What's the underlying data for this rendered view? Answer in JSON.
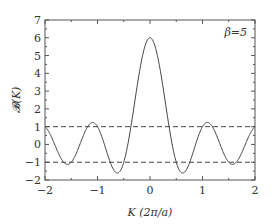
{
  "chart_data": {
    "type": "line",
    "title": "",
    "xlabel": "K (2π/a)",
    "ylabel": "𝓑(K)",
    "xlim": [
      -2,
      2
    ],
    "ylim": [
      -2,
      7
    ],
    "xticks": [
      -2,
      -1,
      0,
      1,
      2
    ],
    "xtick_labels": [
      "−2",
      "−1",
      "0",
      "1",
      "2"
    ],
    "yticks": [
      -2,
      -1,
      0,
      1,
      2,
      3,
      4,
      5,
      6,
      7
    ],
    "ytick_labels": [
      "−2",
      "−1",
      "0",
      "1",
      "2",
      "3",
      "4",
      "5",
      "6",
      "7"
    ],
    "x_minor_step": 0.5,
    "y_minor_step": 0.5,
    "grid": false,
    "annotation": "β=5",
    "annotation_position": "top-right",
    "beta": 5,
    "function": "B(K) = cos(2πK) + β·sin(2πK)/(2πK)",
    "series": [
      {
        "name": "B(K)",
        "style": "solid",
        "x": [
          -2,
          -1.75,
          -1.58,
          -1.5,
          -1.25,
          -1.1,
          -1,
          -0.75,
          -0.62,
          -0.5,
          -0.25,
          0,
          0.25,
          0.5,
          0.62,
          0.75,
          1,
          1.1,
          1.25,
          1.5,
          1.58,
          1.75,
          2
        ],
        "y": [
          1,
          -0.45,
          -1.08,
          -1.0,
          0.64,
          1.27,
          1.0,
          -1.06,
          -1.62,
          -1.0,
          3.18,
          6.0,
          3.18,
          -1.0,
          -1.62,
          -1.06,
          1.0,
          1.27,
          0.64,
          -1.0,
          -1.08,
          -0.45,
          1
        ]
      },
      {
        "name": "upper-bound",
        "style": "dashed",
        "x": [
          -2,
          2
        ],
        "y": [
          1,
          1
        ]
      },
      {
        "name": "lower-bound",
        "style": "dashed",
        "x": [
          -2,
          2
        ],
        "y": [
          -1,
          -1
        ]
      }
    ]
  }
}
